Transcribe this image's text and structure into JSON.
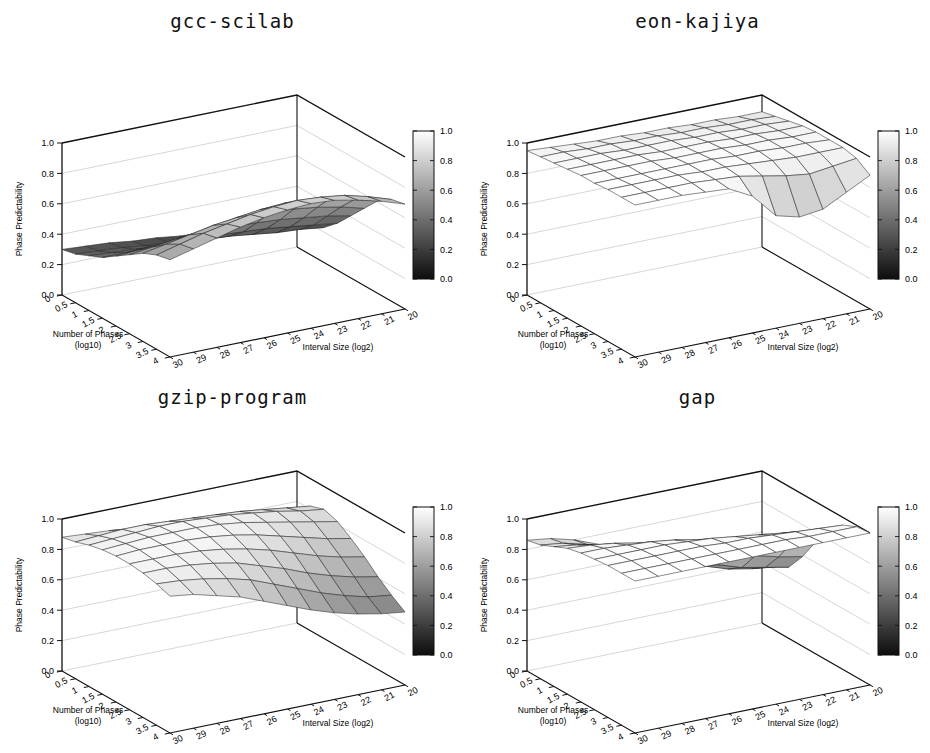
{
  "figure": {
    "panel_count": 4,
    "shared": {
      "zlabel": "Phase Predictability",
      "xlabel_line1": "Number of Phases",
      "xlabel_line2": "(log10)",
      "ylabel": "Interval Size (log2)",
      "z_ticks": [
        "0.0",
        "0.2",
        "0.4",
        "0.6",
        "0.8",
        "1.0"
      ],
      "x_ticks": [
        "0",
        "0.5",
        "1",
        "1.5",
        "2",
        "2.5",
        "3",
        "3.5",
        "4"
      ],
      "y_ticks": [
        "30",
        "29",
        "28",
        "27",
        "26",
        "25",
        "24",
        "23",
        "22",
        "21",
        "20"
      ],
      "colorbar_ticks": [
        "0.0",
        "0.2",
        "0.4",
        "0.6",
        "0.8",
        "1.0"
      ],
      "colorbar_low_color": "#0d0d0d",
      "colorbar_high_color": "#ffffff"
    }
  },
  "chart_data": [
    {
      "type": "heatmap",
      "title": "gcc-scilab",
      "xlabel": "Number of Phases (log10)",
      "ylabel": "Interval Size (log2)",
      "zlabel": "Phase Predictability",
      "xlim": [
        0,
        4
      ],
      "ylim": [
        30,
        20
      ],
      "zlim": [
        0,
        1
      ],
      "x": [
        0,
        0.5,
        1,
        1.5,
        2,
        2.5,
        3,
        3.5,
        4
      ],
      "y": [
        30,
        29,
        28,
        27,
        26,
        25,
        24,
        23,
        22,
        21,
        20
      ],
      "grid": true,
      "legend": "colorbar-right",
      "z": [
        [
          0.3,
          0.32,
          0.36,
          0.4,
          0.46,
          0.52,
          0.58,
          0.62,
          0.64
        ],
        [
          0.29,
          0.31,
          0.35,
          0.4,
          0.47,
          0.54,
          0.61,
          0.66,
          0.68
        ],
        [
          0.28,
          0.3,
          0.34,
          0.4,
          0.48,
          0.56,
          0.64,
          0.7,
          0.72
        ],
        [
          0.26,
          0.28,
          0.33,
          0.4,
          0.49,
          0.58,
          0.67,
          0.73,
          0.76
        ],
        [
          0.25,
          0.27,
          0.32,
          0.4,
          0.5,
          0.6,
          0.69,
          0.76,
          0.79
        ],
        [
          0.23,
          0.26,
          0.31,
          0.39,
          0.5,
          0.61,
          0.71,
          0.78,
          0.81
        ],
        [
          0.22,
          0.24,
          0.3,
          0.38,
          0.49,
          0.61,
          0.72,
          0.79,
          0.82
        ],
        [
          0.2,
          0.23,
          0.28,
          0.37,
          0.48,
          0.6,
          0.71,
          0.78,
          0.81
        ],
        [
          0.19,
          0.21,
          0.26,
          0.35,
          0.46,
          0.58,
          0.69,
          0.76,
          0.78
        ],
        [
          0.18,
          0.2,
          0.25,
          0.33,
          0.44,
          0.55,
          0.65,
          0.72,
          0.74
        ],
        [
          0.17,
          0.19,
          0.23,
          0.31,
          0.41,
          0.51,
          0.61,
          0.67,
          0.69
        ]
      ]
    },
    {
      "type": "heatmap",
      "title": "eon-kajiya",
      "xlabel": "Number of Phases (log10)",
      "ylabel": "Interval Size (log2)",
      "zlabel": "Phase Predictability",
      "xlim": [
        0,
        4
      ],
      "ylim": [
        30,
        20
      ],
      "zlim": [
        0,
        1
      ],
      "x": [
        0,
        0.5,
        1,
        1.5,
        2,
        2.5,
        3,
        3.5,
        4
      ],
      "y": [
        30,
        29,
        28,
        27,
        26,
        25,
        24,
        23,
        22,
        21,
        20
      ],
      "grid": true,
      "legend": "colorbar-right",
      "z": [
        [
          0.95,
          0.96,
          0.97,
          0.98,
          0.99,
          0.99,
          1.0,
          1.0,
          1.0
        ],
        [
          0.94,
          0.96,
          0.97,
          0.98,
          0.99,
          0.99,
          1.0,
          1.0,
          1.0
        ],
        [
          0.93,
          0.95,
          0.97,
          0.98,
          0.99,
          0.99,
          1.0,
          1.0,
          1.0
        ],
        [
          0.92,
          0.95,
          0.96,
          0.98,
          0.99,
          0.99,
          1.0,
          1.0,
          0.99
        ],
        [
          0.92,
          0.94,
          0.96,
          0.97,
          0.98,
          0.99,
          0.99,
          0.99,
          0.98
        ],
        [
          0.91,
          0.94,
          0.96,
          0.97,
          0.98,
          0.99,
          0.99,
          0.98,
          0.9
        ],
        [
          0.91,
          0.93,
          0.95,
          0.97,
          0.98,
          0.98,
          0.98,
          0.95,
          0.74
        ],
        [
          0.9,
          0.93,
          0.95,
          0.96,
          0.97,
          0.98,
          0.97,
          0.92,
          0.7
        ],
        [
          0.9,
          0.92,
          0.94,
          0.96,
          0.97,
          0.97,
          0.96,
          0.9,
          0.72
        ],
        [
          0.89,
          0.92,
          0.94,
          0.95,
          0.96,
          0.97,
          0.96,
          0.92,
          0.8
        ],
        [
          0.89,
          0.91,
          0.93,
          0.95,
          0.96,
          0.96,
          0.96,
          0.94,
          0.88
        ]
      ]
    },
    {
      "type": "heatmap",
      "title": "gzip-program",
      "xlabel": "Number of Phases (log10)",
      "ylabel": "Interval Size (log2)",
      "zlabel": "Phase Predictability",
      "xlim": [
        0,
        4
      ],
      "ylim": [
        30,
        20
      ],
      "zlim": [
        0,
        1
      ],
      "x": [
        0,
        0.5,
        1,
        1.5,
        2,
        2.5,
        3,
        3.5,
        4
      ],
      "y": [
        30,
        29,
        28,
        27,
        26,
        25,
        24,
        23,
        22,
        21,
        20
      ],
      "grid": true,
      "legend": "colorbar-right",
      "z": [
        [
          0.88,
          0.9,
          0.93,
          0.95,
          0.96,
          0.96,
          0.95,
          0.93,
          0.9
        ],
        [
          0.87,
          0.91,
          0.94,
          0.96,
          0.97,
          0.96,
          0.95,
          0.92,
          0.88
        ],
        [
          0.86,
          0.92,
          0.95,
          0.97,
          0.97,
          0.96,
          0.94,
          0.9,
          0.84
        ],
        [
          0.84,
          0.92,
          0.96,
          0.97,
          0.97,
          0.95,
          0.92,
          0.87,
          0.8
        ],
        [
          0.82,
          0.91,
          0.96,
          0.97,
          0.96,
          0.93,
          0.89,
          0.83,
          0.74
        ],
        [
          0.8,
          0.9,
          0.95,
          0.96,
          0.94,
          0.9,
          0.84,
          0.77,
          0.68
        ],
        [
          0.78,
          0.89,
          0.94,
          0.94,
          0.91,
          0.86,
          0.79,
          0.71,
          0.62
        ],
        [
          0.76,
          0.88,
          0.92,
          0.91,
          0.87,
          0.81,
          0.73,
          0.65,
          0.57
        ],
        [
          0.74,
          0.86,
          0.9,
          0.88,
          0.83,
          0.76,
          0.68,
          0.6,
          0.53
        ],
        [
          0.72,
          0.84,
          0.87,
          0.85,
          0.79,
          0.72,
          0.64,
          0.56,
          0.5
        ],
        [
          0.7,
          0.82,
          0.85,
          0.82,
          0.76,
          0.69,
          0.61,
          0.54,
          0.48
        ]
      ]
    },
    {
      "type": "heatmap",
      "title": "gap",
      "xlabel": "Number of Phases (log10)",
      "ylabel": "Interval Size (log2)",
      "zlabel": "Phase Predictability",
      "xlim": [
        0,
        4
      ],
      "ylim": [
        30,
        20
      ],
      "zlim": [
        0,
        1
      ],
      "x": [
        0,
        0.5,
        1,
        1.5,
        2,
        2.5,
        3,
        3.5,
        4
      ],
      "y": [
        30,
        29,
        28,
        27,
        26,
        25,
        24,
        23,
        22,
        21,
        20
      ],
      "grid": true,
      "legend": "colorbar-right",
      "z": [
        [
          0.86,
          0.88,
          0.92,
          0.96,
          0.98,
          0.99,
          1.0,
          1.0,
          1.0
        ],
        [
          0.84,
          0.86,
          0.9,
          0.95,
          0.98,
          0.99,
          1.0,
          1.0,
          1.0
        ],
        [
          0.8,
          0.82,
          0.87,
          0.93,
          0.97,
          0.99,
          1.0,
          1.0,
          1.0
        ],
        [
          0.74,
          0.76,
          0.82,
          0.9,
          0.96,
          0.99,
          1.0,
          1.0,
          1.0
        ],
        [
          0.68,
          0.7,
          0.76,
          0.86,
          0.94,
          0.98,
          1.0,
          1.0,
          1.0
        ],
        [
          0.62,
          0.64,
          0.7,
          0.81,
          0.91,
          0.97,
          0.99,
          1.0,
          1.0
        ],
        [
          0.56,
          0.58,
          0.64,
          0.76,
          0.88,
          0.95,
          0.99,
          1.0,
          1.0
        ],
        [
          0.5,
          0.52,
          0.58,
          0.71,
          0.84,
          0.93,
          0.98,
          1.0,
          1.0
        ],
        [
          0.45,
          0.47,
          0.53,
          0.66,
          0.8,
          0.91,
          0.97,
          0.99,
          1.0
        ],
        [
          0.42,
          0.44,
          0.5,
          0.62,
          0.77,
          0.89,
          0.96,
          0.99,
          1.0
        ],
        [
          0.4,
          0.42,
          0.47,
          0.59,
          0.74,
          0.87,
          0.95,
          0.99,
          1.0
        ]
      ]
    }
  ]
}
